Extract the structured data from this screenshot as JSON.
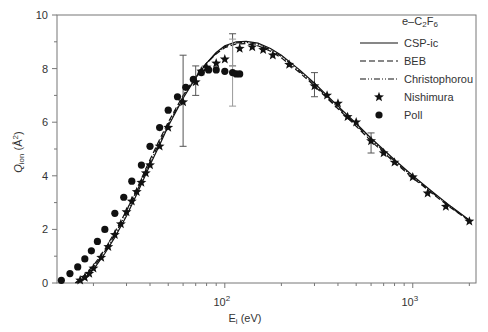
{
  "chart_data": {
    "type": "line",
    "title": "e–C2F6",
    "xlabel": "E_i (eV)",
    "ylabel": "Q_ion (Å^2)",
    "xscale": "log",
    "xlim": [
      12.8,
      2170
    ],
    "ylim": [
      0,
      10
    ],
    "yticks": [
      0,
      2,
      4,
      6,
      8,
      10
    ],
    "xtick_labels": [
      {
        "value": 100,
        "label": "10",
        "exp": "2"
      },
      {
        "value": 1000,
        "label": "10",
        "exp": "3"
      }
    ],
    "grid": false,
    "legend_position": "upper right",
    "legend": [
      {
        "name": "CSP-ic",
        "style": "solid"
      },
      {
        "name": "BEB",
        "style": "dashed"
      },
      {
        "name": "Christophorou",
        "style": "dash-dot-dot"
      },
      {
        "name": "Nishimura",
        "style": "star-marker"
      },
      {
        "name": "Poll",
        "style": "circle-marker"
      }
    ],
    "series": [
      {
        "name": "CSP-ic",
        "style": "solid",
        "x": [
          16.5,
          18,
          20,
          23,
          26,
          30,
          35,
          40,
          45,
          50,
          60,
          70,
          80,
          90,
          100,
          115,
          130,
          150,
          175,
          200,
          250,
          300,
          400,
          500,
          600,
          800,
          1000,
          1300,
          1600,
          2000
        ],
        "y": [
          0.0,
          0.2,
          0.5,
          1.1,
          1.7,
          2.5,
          3.5,
          4.4,
          5.15,
          5.85,
          6.9,
          7.65,
          8.2,
          8.6,
          8.85,
          9.0,
          9.02,
          8.95,
          8.75,
          8.5,
          7.95,
          7.45,
          6.6,
          5.95,
          5.4,
          4.6,
          4.0,
          3.35,
          2.85,
          2.35
        ]
      },
      {
        "name": "BEB",
        "style": "dashed",
        "x": [
          16.0,
          18,
          20,
          23,
          26,
          30,
          35,
          40,
          45,
          50,
          60,
          70,
          80,
          90,
          100,
          115,
          130,
          150,
          175,
          200,
          250,
          300,
          400,
          500,
          600,
          800,
          1000,
          1300,
          1600,
          2000
        ],
        "y": [
          0.0,
          0.3,
          0.65,
          1.25,
          1.9,
          2.7,
          3.7,
          4.6,
          5.35,
          6.0,
          7.0,
          7.7,
          8.2,
          8.55,
          8.78,
          8.92,
          8.93,
          8.85,
          8.65,
          8.4,
          7.85,
          7.35,
          6.5,
          5.85,
          5.3,
          4.5,
          3.92,
          3.28,
          2.8,
          2.32
        ]
      },
      {
        "name": "Christophorou",
        "style": "dash-dot-dot",
        "x": [
          16.2,
          18,
          20,
          23,
          26,
          30,
          35,
          40,
          45,
          50,
          60,
          70,
          80,
          90,
          100,
          115,
          130,
          150,
          175,
          200,
          250,
          300,
          400,
          500,
          600,
          800,
          1000,
          1300,
          1600,
          2000
        ],
        "y": [
          0.0,
          0.25,
          0.58,
          1.18,
          1.8,
          2.6,
          3.6,
          4.5,
          5.25,
          5.92,
          6.95,
          7.68,
          8.2,
          8.58,
          8.82,
          8.96,
          8.98,
          8.9,
          8.7,
          8.45,
          7.9,
          7.4,
          6.55,
          5.9,
          5.35,
          4.55,
          3.96,
          3.31,
          2.82,
          2.33
        ]
      },
      {
        "name": "Nishimura",
        "style": "star",
        "x": [
          17,
          18,
          19,
          20,
          22,
          24,
          26,
          28,
          30,
          32,
          34,
          36,
          38,
          40,
          45,
          50,
          60,
          70,
          75,
          80,
          90,
          100,
          120,
          140,
          160,
          180,
          220,
          300,
          350,
          400,
          450,
          500,
          600,
          700,
          800,
          1000,
          1200,
          1500,
          2000
        ],
        "y": [
          0.1,
          0.2,
          0.35,
          0.55,
          0.95,
          1.35,
          1.8,
          2.2,
          2.65,
          3.05,
          3.4,
          3.75,
          4.1,
          4.4,
          5.1,
          5.8,
          6.75,
          7.5,
          7.9,
          8.05,
          8.2,
          8.35,
          8.75,
          8.8,
          8.7,
          8.5,
          8.15,
          7.35,
          7.0,
          6.7,
          6.2,
          6.0,
          5.3,
          4.85,
          4.5,
          3.95,
          3.35,
          2.85,
          2.3
        ],
        "error_bars": [
          {
            "x": 60,
            "y": 6.75,
            "low": 5.1,
            "high": 8.5
          },
          {
            "x": 70,
            "y": 7.5,
            "low": 7.0,
            "high": 8.1
          },
          {
            "x": 110,
            "y": 8.7,
            "low": 8.1,
            "high": 9.3
          },
          {
            "x": 300,
            "y": 7.35,
            "low": 6.95,
            "high": 7.85
          },
          {
            "x": 600,
            "y": 5.3,
            "low": 4.85,
            "high": 5.6
          }
        ]
      },
      {
        "name": "Poll",
        "style": "circle",
        "x": [
          13.5,
          15,
          16.5,
          18,
          19.5,
          21,
          23,
          26,
          29,
          32,
          36,
          40,
          45,
          50,
          56,
          62,
          68,
          75,
          82,
          90,
          100,
          110,
          115,
          120
        ],
        "y": [
          0.1,
          0.35,
          0.6,
          0.9,
          1.2,
          1.55,
          2.0,
          2.6,
          3.2,
          3.8,
          4.4,
          5.1,
          5.8,
          6.45,
          6.95,
          7.3,
          7.6,
          7.85,
          7.95,
          7.95,
          7.9,
          7.85,
          7.8,
          7.8
        ],
        "error_bars": [
          {
            "x": 110,
            "y": 7.9,
            "low": 6.6,
            "high": 9.1
          }
        ]
      }
    ]
  },
  "labels": {
    "title_prefix": "e–C",
    "title_sub1": "2",
    "title_mid": "F",
    "title_sub2": "6",
    "ylabel_main": "Q",
    "ylabel_sub": "ion",
    "ylabel_unit": " (Å",
    "ylabel_sup": "2",
    "ylabel_close": ")",
    "xlabel_main": "E",
    "xlabel_sub": "i",
    "xlabel_unit": " (eV)"
  }
}
